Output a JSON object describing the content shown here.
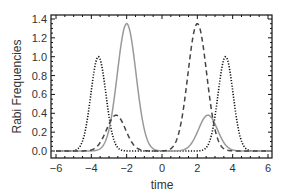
{
  "chart_data": {
    "type": "line",
    "title": "",
    "xlabel": "time",
    "ylabel": "Rabi Frequencies",
    "xlim": [
      -6.3,
      6.3
    ],
    "ylim": [
      -0.05,
      1.45
    ],
    "xticks": [
      -6,
      -4,
      -2,
      0,
      2,
      4,
      6
    ],
    "xtick_labels": [
      "−6",
      "−4",
      "−2",
      "0",
      "2",
      "4",
      "6"
    ],
    "yticks": [
      0.0,
      0.2,
      0.4,
      0.6,
      0.8,
      1.0,
      1.2,
      1.4
    ],
    "ytick_labels": [
      "0.0",
      "0.2",
      "0.4",
      "0.6",
      "0.8",
      "1.0",
      "1.2",
      "1.4"
    ],
    "grid": false,
    "legend": "none",
    "series": [
      {
        "name": "dotted",
        "style": "dotted",
        "color": "#111111",
        "components": [
          {
            "center": -3.6,
            "amplitude": 1.0,
            "width": 0.6
          },
          {
            "center": 3.6,
            "amplitude": 1.0,
            "width": 0.6
          }
        ]
      },
      {
        "name": "solid",
        "style": "solid",
        "color": "#999999",
        "components": [
          {
            "center": -2.0,
            "amplitude": 1.35,
            "width": 0.75
          },
          {
            "center": 2.6,
            "amplitude": 0.38,
            "width": 0.75
          }
        ]
      },
      {
        "name": "dashed",
        "style": "dashed",
        "color": "#444444",
        "components": [
          {
            "center": -2.6,
            "amplitude": 0.38,
            "width": 0.75
          },
          {
            "center": 2.0,
            "amplitude": 1.35,
            "width": 0.75
          }
        ]
      }
    ]
  }
}
